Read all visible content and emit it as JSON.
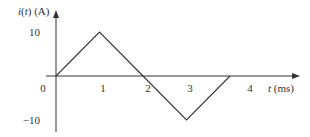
{
  "chart_data": {
    "type": "line",
    "title": "",
    "xlabel": "t (ms)",
    "ylabel": "i(t) (A)",
    "x": [
      0,
      1,
      2,
      3,
      4
    ],
    "series": [
      {
        "name": "i(t)",
        "values": [
          0,
          10,
          0,
          -10,
          0
        ]
      }
    ],
    "x_ticks": [
      "0",
      "1",
      "2",
      "3",
      "4"
    ],
    "y_ticks": [
      "10",
      "-10"
    ],
    "xlim": [
      0,
      4.8
    ],
    "ylim": [
      -13,
      15
    ],
    "grid": false,
    "legend": "none",
    "line_color": "#333333"
  }
}
